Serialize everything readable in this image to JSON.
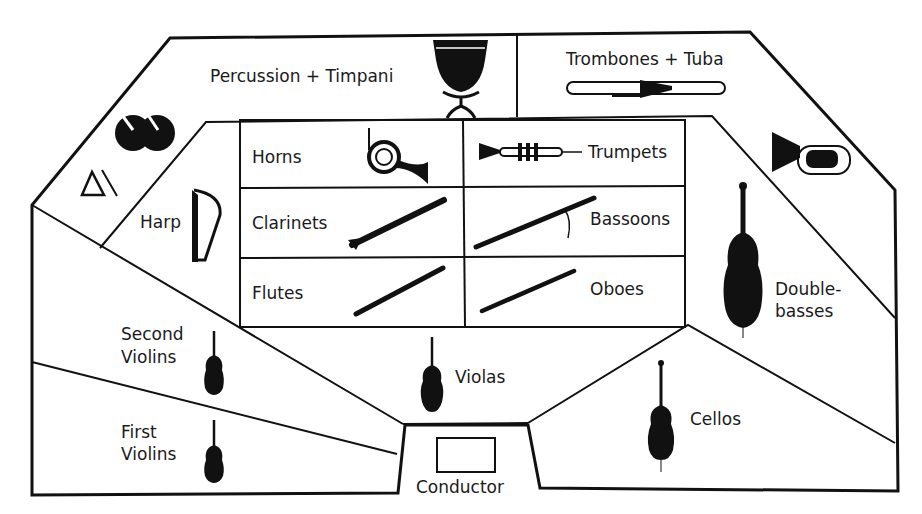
{
  "diagram": {
    "colors": {
      "ink": "#111111",
      "background": "#ffffff"
    },
    "sections": {
      "percussion": {
        "label": "Percussion + Timpani",
        "icons": [
          "timpani-icon",
          "cymbals-icon",
          "triangle-icon"
        ]
      },
      "brass_back": {
        "label": "Trombones + Tuba",
        "icons": [
          "trombone-icon",
          "tuba-icon"
        ]
      },
      "harp": {
        "label": "Harp",
        "icons": [
          "harp-icon"
        ]
      },
      "horns": {
        "label": "Horns",
        "icons": [
          "french-horn-icon"
        ]
      },
      "trumpets": {
        "label": "Trumpets",
        "icons": [
          "trumpet-icon"
        ]
      },
      "clarinets": {
        "label": "Clarinets",
        "icons": [
          "clarinet-icon"
        ]
      },
      "bassoons": {
        "label": "Bassoons",
        "icons": [
          "bassoon-icon"
        ]
      },
      "flutes": {
        "label": "Flutes",
        "icons": [
          "flute-icon"
        ]
      },
      "oboes": {
        "label": "Oboes",
        "icons": [
          "oboe-icon"
        ]
      },
      "double_basses": {
        "label_line1": "Double-",
        "label_line2": "basses",
        "icons": [
          "double-bass-icon"
        ]
      },
      "second_violins": {
        "label_line1": "Second",
        "label_line2": "Violins",
        "icons": [
          "violin-icon"
        ]
      },
      "first_violins": {
        "label_line1": "First",
        "label_line2": "Violins",
        "icons": [
          "violin-icon"
        ]
      },
      "violas": {
        "label": "Violas",
        "icons": [
          "viola-icon"
        ]
      },
      "cellos": {
        "label": "Cellos",
        "icons": [
          "cello-icon"
        ]
      },
      "conductor": {
        "label": "Conductor",
        "icons": [
          "podium-icon"
        ]
      }
    }
  }
}
